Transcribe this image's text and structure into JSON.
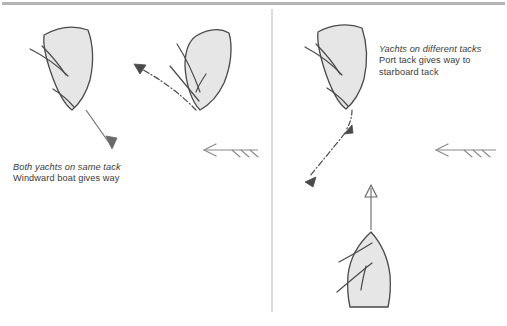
{
  "figure": {
    "width": 507,
    "height": 326,
    "background_color": "#ffffff",
    "border_color": "#b4b4b4",
    "divider_color": "#c8c8c8"
  },
  "style": {
    "hull_fill": "#e6e6e6",
    "hull_stroke": "#4a4a4a",
    "rig_stroke": "#4a4a4a",
    "course_arrow_color": "#6a6a6a",
    "dash_arrow_color": "#4a4a4a",
    "wind_arrow_color": "#8a8a8a",
    "text_color": "#3a3a3a"
  },
  "panels": [
    {
      "id": "left",
      "caption": {
        "emphasis": "Both yachts on same tack",
        "lines": [
          "Windward boat gives way"
        ]
      },
      "boats": [
        {
          "name": "windward-boat",
          "heading": "down-right",
          "course_arrow": "solid"
        },
        {
          "name": "leeward-boat",
          "heading": "up-left",
          "course_arrow": "dash-dot"
        }
      ],
      "wind_arrow": {
        "direction": "left",
        "barbs": 3
      }
    },
    {
      "id": "right",
      "caption": {
        "emphasis": "Yachts on different tacks",
        "lines": [
          "Port tack gives way to",
          "starboard tack"
        ]
      },
      "boats": [
        {
          "name": "port-tack-boat",
          "heading": "down-left",
          "course_arrow": "dash-dot"
        },
        {
          "name": "starboard-tack-boat",
          "heading": "up",
          "course_arrow": "solid"
        }
      ],
      "wind_arrow": {
        "direction": "left",
        "barbs": 3
      }
    }
  ]
}
